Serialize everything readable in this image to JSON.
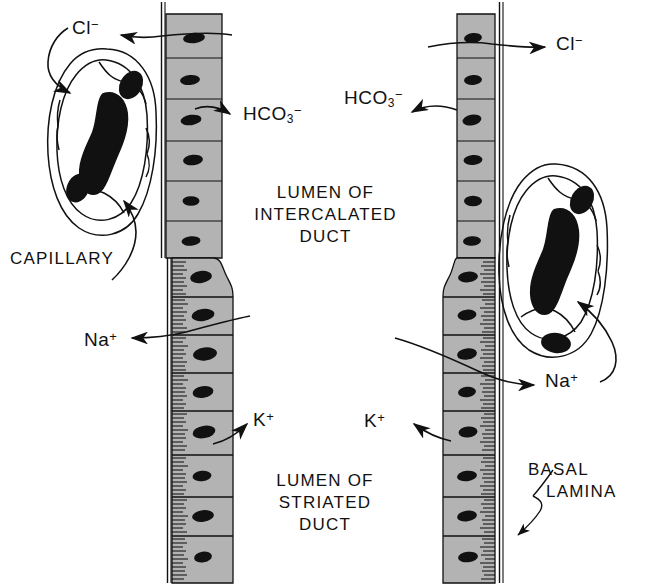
{
  "figure": {
    "background_color": "#ffffff",
    "ink_color": "#111111",
    "epithelium_fill": "#b3b3b3",
    "nucleus_color": "#111111"
  },
  "labels": {
    "chloride": {
      "ion": "Cl",
      "charge": "−"
    },
    "bicarbonate": {
      "ion": "HCO",
      "sub": "3",
      "charge": "−"
    },
    "sodium": {
      "ion": "Na",
      "charge": "+"
    },
    "potassium": {
      "ion": "K",
      "charge": "+"
    },
    "capillary": "CAPILLARY",
    "basal_lamina_line1": "BASAL",
    "basal_lamina_line2": "LAMINA",
    "lumen_intercalated_line1": "LUMEN OF",
    "lumen_intercalated_line2": "INTERCALATED",
    "lumen_intercalated_line3": "DUCT",
    "lumen_striated_line1": "LUMEN OF",
    "lumen_striated_line2": "STRIATED",
    "lumen_striated_line3": "DUCT"
  },
  "left_duct": {
    "name": "left-duct-column",
    "intercalated_cell_count": 7,
    "striated_cell_count": 8,
    "intercalated_x_range": [
      166,
      222
    ],
    "striated_x_range": [
      172,
      233
    ],
    "transition_y": 258
  },
  "right_duct": {
    "name": "right-duct-column",
    "intercalated_cell_count": 7,
    "striated_cell_count": 8,
    "intercalated_x_range": [
      457,
      492
    ],
    "striated_x_range": [
      443,
      492
    ],
    "transition_y": 258
  },
  "capillaries": [
    {
      "name": "left-capillary",
      "center": [
        105,
        150
      ],
      "nuclei": 3
    },
    {
      "name": "right-capillary",
      "center": [
        556,
        270
      ],
      "nuclei": 3
    }
  ],
  "arrows": [
    {
      "name": "arrow-chloride-left",
      "from": "left-duct-cell-1",
      "to": "Cl-label-left"
    },
    {
      "name": "arrow-bicarbonate-left",
      "from": "left-duct-cell-3",
      "to": "HCO3-label-left"
    },
    {
      "name": "arrow-sodium-left",
      "from": "left-duct-striated",
      "to": "Na-label-left"
    },
    {
      "name": "arrow-potassium-left",
      "from": "left-duct-striated",
      "to": "K-label-left"
    },
    {
      "name": "arrow-capillary-left",
      "from": "CAPILLARY-label",
      "to": "left-capillary"
    },
    {
      "name": "arrow-cl-into-capillary-left",
      "from": "Cl-label-left",
      "to": "left-capillary"
    },
    {
      "name": "arrow-chloride-right",
      "from": "right-duct-cell-1",
      "to": "Cl-label-right"
    },
    {
      "name": "arrow-bicarbonate-right",
      "from": "right-duct-cell-3",
      "to": "HCO3-label-right"
    },
    {
      "name": "arrow-sodium-right",
      "from": "right-duct-striated",
      "to": "Na-label-right"
    },
    {
      "name": "arrow-na-into-capillary-right",
      "from": "Na-label-right",
      "to": "right-capillary"
    },
    {
      "name": "arrow-potassium-right",
      "from": "right-duct-striated",
      "to": "K-label-right"
    },
    {
      "name": "arrow-basal-lamina",
      "from": "BASAL-LAMINA-label",
      "to": "right-basal-lamina"
    }
  ]
}
